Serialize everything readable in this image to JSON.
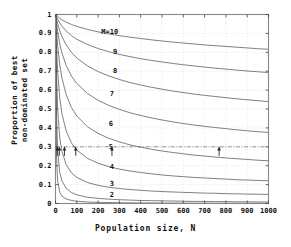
{
  "chart_data": {
    "type": "line",
    "title": "",
    "xlabel": "Population size, N",
    "ylabel": "Proportion of best non-dominated set",
    "ylabel_line1": "Proportion of best",
    "ylabel_line2": "non-dominated set",
    "xlim": [
      0,
      1000
    ],
    "ylim": [
      0,
      1
    ],
    "xticks": [
      0,
      100,
      200,
      300,
      400,
      500,
      600,
      700,
      800,
      900,
      1000
    ],
    "xtick_labels": [
      "0",
      "100",
      "200",
      "300",
      "400",
      "500",
      "600",
      "700",
      "800",
      "900",
      "1000"
    ],
    "yticks": [
      0,
      0.1,
      0.2,
      0.3,
      0.4,
      0.5,
      0.6,
      0.7,
      0.8,
      0.9,
      1
    ],
    "ytick_labels": [
      "0",
      "0.1",
      "0.2",
      "0.3",
      "0.4",
      "0.5",
      "0.6",
      "0.7",
      "0.8",
      "0.9",
      "1"
    ],
    "grid": true,
    "grid_style": "dotted",
    "legend_position": "inline-curve-labels",
    "line_color": "#555555",
    "grid_color": "#c8c8c8",
    "axis_color": "#888888",
    "reference_line": {
      "y": 0.3,
      "style": "dash-dot",
      "label": ""
    },
    "series": [
      {
        "name": "M=10",
        "label": "M=10",
        "M": 10,
        "x": [
          1,
          5,
          10,
          20,
          30,
          50,
          75,
          100,
          150,
          200,
          250,
          300,
          350,
          400,
          450,
          500,
          550,
          600,
          650,
          700,
          750,
          800,
          850,
          900,
          950,
          1000
        ],
        "y": [
          1.0,
          0.995,
          0.99,
          0.98,
          0.972,
          0.96,
          0.947,
          0.937,
          0.921,
          0.908,
          0.897,
          0.888,
          0.88,
          0.873,
          0.866,
          0.86,
          0.854,
          0.849,
          0.844,
          0.839,
          0.835,
          0.831,
          0.827,
          0.823,
          0.819,
          0.816
        ]
      },
      {
        "name": "9",
        "label": "9",
        "M": 9,
        "x": [
          1,
          5,
          10,
          20,
          30,
          50,
          75,
          100,
          150,
          200,
          250,
          300,
          350,
          400,
          450,
          500,
          550,
          600,
          650,
          700,
          750,
          800,
          850,
          900,
          950,
          1000
        ],
        "y": [
          1.0,
          0.988,
          0.976,
          0.955,
          0.938,
          0.913,
          0.888,
          0.869,
          0.841,
          0.82,
          0.803,
          0.789,
          0.777,
          0.766,
          0.757,
          0.749,
          0.741,
          0.734,
          0.728,
          0.722,
          0.716,
          0.711,
          0.706,
          0.701,
          0.697,
          0.693
        ]
      },
      {
        "name": "8",
        "label": "8",
        "M": 8,
        "x": [
          1,
          5,
          10,
          20,
          30,
          50,
          75,
          100,
          150,
          200,
          250,
          300,
          350,
          400,
          450,
          500,
          550,
          600,
          650,
          700,
          750,
          800,
          850,
          900,
          950,
          1000
        ],
        "y": [
          1.0,
          0.975,
          0.952,
          0.913,
          0.883,
          0.84,
          0.799,
          0.77,
          0.728,
          0.698,
          0.675,
          0.656,
          0.64,
          0.627,
          0.615,
          0.605,
          0.595,
          0.587,
          0.579,
          0.572,
          0.566,
          0.56,
          0.554,
          0.549,
          0.544,
          0.539
        ]
      },
      {
        "name": "7",
        "label": "7",
        "M": 7,
        "x": [
          1,
          5,
          10,
          20,
          30,
          50,
          75,
          100,
          150,
          200,
          250,
          300,
          350,
          400,
          450,
          500,
          550,
          600,
          650,
          700,
          750,
          800,
          850,
          900,
          950,
          1000
        ],
        "y": [
          1.0,
          0.952,
          0.91,
          0.844,
          0.797,
          0.731,
          0.674,
          0.635,
          0.582,
          0.546,
          0.519,
          0.498,
          0.48,
          0.466,
          0.453,
          0.442,
          0.432,
          0.423,
          0.415,
          0.408,
          0.402,
          0.396,
          0.39,
          0.385,
          0.38,
          0.376
        ]
      },
      {
        "name": "6",
        "label": "6",
        "M": 6,
        "x": [
          1,
          5,
          10,
          20,
          30,
          50,
          75,
          100,
          150,
          200,
          250,
          300,
          350,
          400,
          450,
          500,
          550,
          600,
          650,
          700,
          750,
          800,
          850,
          900,
          950,
          1000
        ],
        "y": [
          1.0,
          0.908,
          0.836,
          0.733,
          0.665,
          0.577,
          0.507,
          0.463,
          0.406,
          0.371,
          0.345,
          0.326,
          0.31,
          0.298,
          0.287,
          0.278,
          0.27,
          0.263,
          0.256,
          0.251,
          0.246,
          0.241,
          0.237,
          0.233,
          0.229,
          0.226
        ]
      },
      {
        "name": "5",
        "label": "5",
        "M": 5,
        "x": [
          1,
          5,
          10,
          20,
          30,
          50,
          75,
          100,
          150,
          200,
          250,
          300,
          350,
          400,
          450,
          500,
          550,
          600,
          650,
          700,
          750,
          800,
          850,
          900,
          950,
          1000
        ],
        "y": [
          1.0,
          0.823,
          0.703,
          0.557,
          0.476,
          0.385,
          0.32,
          0.283,
          0.239,
          0.213,
          0.195,
          0.182,
          0.172,
          0.164,
          0.157,
          0.151,
          0.146,
          0.142,
          0.138,
          0.135,
          0.132,
          0.129,
          0.126,
          0.124,
          0.122,
          0.12
        ]
      },
      {
        "name": "4",
        "label": "4",
        "M": 4,
        "x": [
          1,
          5,
          10,
          20,
          30,
          50,
          75,
          100,
          150,
          200,
          250,
          300,
          350,
          400,
          450,
          500,
          550,
          600,
          650,
          700,
          750,
          800,
          850,
          900,
          950,
          1000
        ],
        "y": [
          1.0,
          0.672,
          0.499,
          0.347,
          0.276,
          0.206,
          0.162,
          0.138,
          0.111,
          0.096,
          0.086,
          0.079,
          0.074,
          0.07,
          0.066,
          0.063,
          0.061,
          0.059,
          0.057,
          0.055,
          0.054,
          0.052,
          0.051,
          0.05,
          0.049,
          0.048
        ]
      },
      {
        "name": "3",
        "label": "3",
        "M": 3,
        "x": [
          1,
          5,
          10,
          20,
          30,
          50,
          75,
          100,
          150,
          200,
          250,
          300,
          350,
          400,
          450,
          500,
          550,
          600,
          650,
          700,
          750,
          800,
          850,
          900,
          950,
          1000
        ],
        "y": [
          1.0,
          0.456,
          0.279,
          0.165,
          0.12,
          0.08,
          0.058,
          0.046,
          0.033,
          0.027,
          0.023,
          0.02,
          0.018,
          0.016,
          0.015,
          0.014,
          0.013,
          0.012,
          0.011,
          0.011,
          0.01,
          0.01,
          0.009,
          0.009,
          0.008,
          0.008
        ]
      },
      {
        "name": "2",
        "label": "2",
        "M": 2,
        "x": [
          1,
          5,
          10,
          20,
          30,
          50,
          75,
          100,
          150,
          200,
          250,
          300,
          350,
          400,
          450,
          500,
          550,
          600,
          650,
          700,
          750,
          800,
          850,
          900,
          950,
          1000
        ],
        "y": [
          1.0,
          0.24,
          0.12,
          0.06,
          0.04,
          0.024,
          0.016,
          0.012,
          0.008,
          0.006,
          0.005,
          0.004,
          0.0034,
          0.003,
          0.0027,
          0.0024,
          0.0022,
          0.002,
          0.0018,
          0.0017,
          0.0016,
          0.0015,
          0.0014,
          0.0013,
          0.0013,
          0.0012
        ]
      }
    ],
    "curve_labels": [
      {
        "text": "M=10",
        "x": 215,
        "y": 0.905
      },
      {
        "text": "9",
        "x": 270,
        "y": 0.8
      },
      {
        "text": "8",
        "x": 270,
        "y": 0.7
      },
      {
        "text": "7",
        "x": 255,
        "y": 0.58
      },
      {
        "text": "6",
        "x": 250,
        "y": 0.42
      },
      {
        "text": "5",
        "x": 250,
        "y": 0.3
      },
      {
        "text": "4",
        "x": 255,
        "y": 0.195
      },
      {
        "text": "3",
        "x": 255,
        "y": 0.105
      },
      {
        "text": "2",
        "x": 255,
        "y": 0.043
      }
    ],
    "annotations": [
      {
        "type": "arrow",
        "x": 8,
        "y": 0.3,
        "series": "2"
      },
      {
        "type": "arrow",
        "x": 18,
        "y": 0.3,
        "series": "3"
      },
      {
        "type": "arrow",
        "x": 42,
        "y": 0.3,
        "series": "4"
      },
      {
        "type": "arrow",
        "x": 95,
        "y": 0.3,
        "series": "5"
      },
      {
        "type": "arrow",
        "x": 265,
        "y": 0.3,
        "series": "6"
      },
      {
        "type": "arrow",
        "x": 768,
        "y": 0.3,
        "series": "7"
      }
    ]
  }
}
